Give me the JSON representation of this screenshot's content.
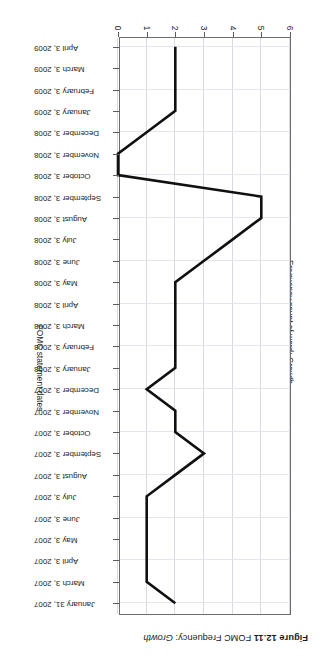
{
  "figure": {
    "number_label": "Figure 12.11",
    "title_plain": "FOMC Frequency:",
    "title_italic": "Growth"
  },
  "axes": {
    "value_axis_title": "Frequency count of word: Growth",
    "category_axis_title": "FOMC statement dates",
    "value_ticks": [
      "0",
      "1",
      "2",
      "3",
      "4",
      "5",
      "6"
    ],
    "value_min": 0,
    "value_max": 6
  },
  "colors": {
    "line": "#101010",
    "frame": "#6d6d6d",
    "grid": "#d9d9e2",
    "text": "#1b1b1b",
    "background": "#ffffff"
  },
  "chart_data": {
    "type": "line",
    "title": "FOMC Frequency: Growth",
    "xlabel": "FOMC statement dates",
    "ylabel": "Frequency count of word: Growth",
    "ylim": [
      0,
      6
    ],
    "grid": true,
    "legend": "none",
    "orientation": "rotated-180",
    "categories": [
      "January 31, 2007",
      "March 3, 2007",
      "April 3, 2007",
      "May 3, 2007",
      "June 3, 2007",
      "July 3, 2007",
      "August 3, 2007",
      "September 3, 2007",
      "October 3, 2007",
      "November 3, 2007",
      "December 3, 2007",
      "January 3, 2008",
      "February 3, 2008",
      "March 3, 2008",
      "April 3, 2008",
      "May 3, 2008",
      "June 3, 2008",
      "July 3, 2008",
      "August 3, 2008",
      "September 3, 2008",
      "October 3, 2008",
      "November 3, 2008",
      "December 3, 2008",
      "January 3, 2009",
      "February 3, 2009",
      "March 3, 2009",
      "April 3, 2009"
    ],
    "values": [
      2,
      1,
      1,
      1,
      1,
      1,
      2,
      3,
      2,
      2,
      1,
      2,
      2,
      2,
      2,
      2,
      3,
      4,
      5,
      5,
      0,
      0,
      1,
      2,
      2,
      2,
      2
    ],
    "series": [
      {
        "name": "Frequency count of word: Growth",
        "values": [
          2,
          1,
          1,
          1,
          1,
          1,
          2,
          3,
          2,
          2,
          1,
          2,
          2,
          2,
          2,
          2,
          3,
          4,
          5,
          5,
          0,
          0,
          1,
          2,
          2,
          2,
          2
        ]
      }
    ]
  }
}
